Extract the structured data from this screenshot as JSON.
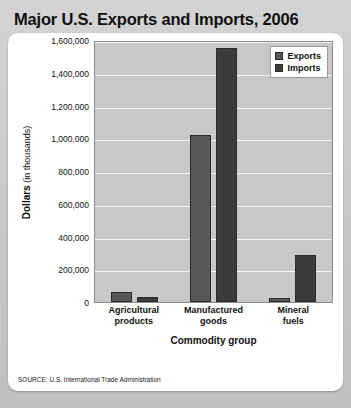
{
  "title": "Major U.S. Exports and Imports, 2006",
  "source_note": "SOURCE: U.S. International Trade Administration",
  "axis": {
    "ylabel_strong": "Dollars",
    "ylabel_weak": " (in thousands)",
    "xlabel": "Commodity group"
  },
  "legend": {
    "exports_label": "Exports",
    "imports_label": "Imports"
  },
  "colors": {
    "exports": "#575757",
    "imports": "#3b3b3b",
    "plot_background": "#c8c8c8",
    "gridline": "#f4f4f4",
    "card_background": "#ffffff",
    "page_background": "#c9c9c9"
  },
  "chart_data": {
    "type": "bar",
    "title": "Major U.S. Exports and Imports, 2006",
    "xlabel": "Commodity group",
    "ylabel": "Dollars (in thousands)",
    "categories": [
      "Agricultural products",
      "Manufactured goods",
      "Mineral fuels"
    ],
    "category_lines": [
      [
        "Agricultural",
        "products"
      ],
      [
        "Manufactured",
        "goods"
      ],
      [
        "Mineral",
        "fuels"
      ]
    ],
    "series": [
      {
        "name": "Exports",
        "values": [
          65000,
          1020000,
          25000
        ]
      },
      {
        "name": "Imports",
        "values": [
          30000,
          1550000,
          290000
        ]
      }
    ],
    "ylim": [
      0,
      1600000
    ],
    "ytick_step": 200000,
    "yticks": [
      0,
      200000,
      400000,
      600000,
      800000,
      1000000,
      1200000,
      1400000,
      1600000
    ],
    "ytick_labels": [
      "0",
      "200,000",
      "400,000",
      "600,000",
      "800,000",
      "1,000,000",
      "1,200,000",
      "1,400,000",
      "1,600,000"
    ],
    "grid": true,
    "legend_position": "top-right"
  }
}
